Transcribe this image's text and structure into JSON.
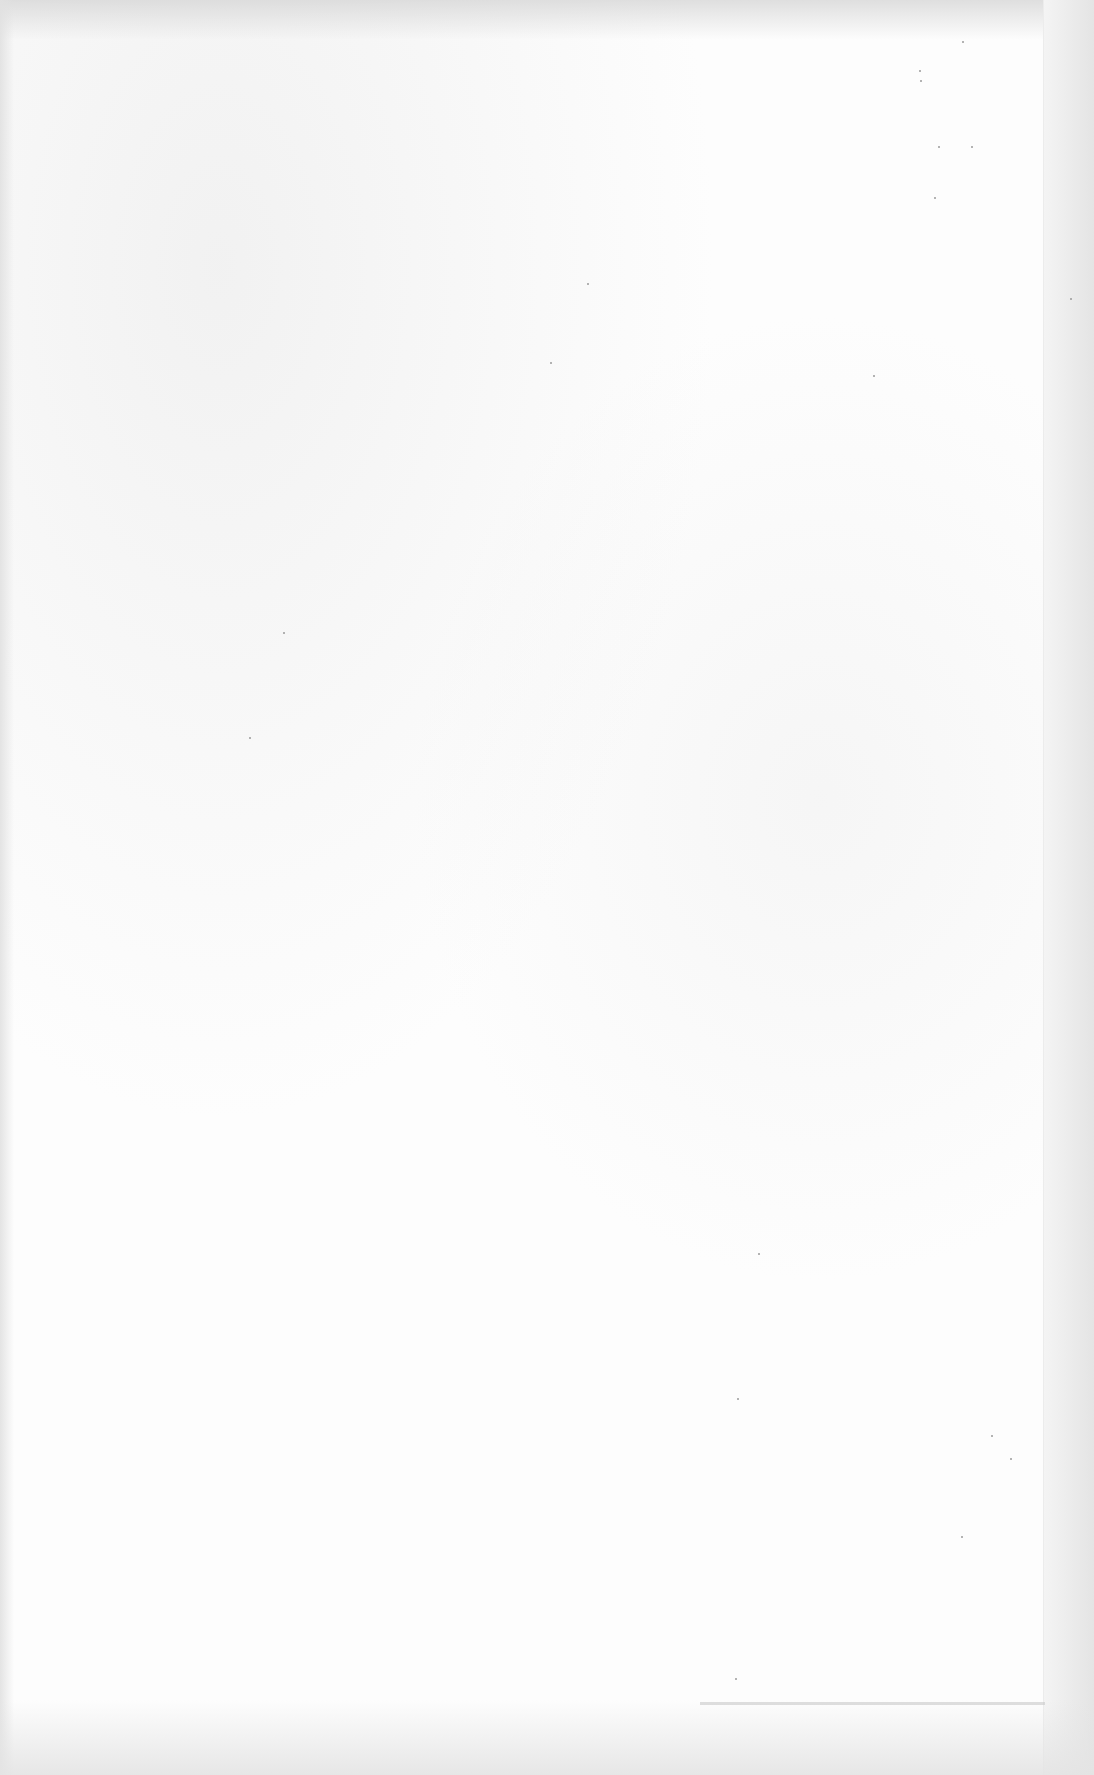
{
  "document": {
    "type": "blank-scanned-page",
    "text_content": [],
    "colors": {
      "paper": "#fdfdfd",
      "edge_shadow": "#e4e4e4",
      "speckle": "#9a9a9a"
    }
  }
}
